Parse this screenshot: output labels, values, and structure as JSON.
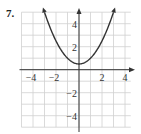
{
  "problem_number": "7.",
  "chart_data": {
    "type": "line",
    "title": "",
    "xlabel": "",
    "ylabel": "",
    "function": "y = 0.5x^2 + 0.5",
    "xlim": [
      -5,
      4.5
    ],
    "ylim": [
      -5,
      5
    ],
    "grid": true,
    "x_tick_labels": [
      "-4",
      "-2",
      "2",
      "4"
    ],
    "y_tick_labels": [
      "4",
      "2",
      "-2",
      "-4"
    ],
    "series": [
      {
        "name": "parabola",
        "x": [
          -3.1,
          -3,
          -2.5,
          -2,
          -1.5,
          -1,
          -0.5,
          0,
          0.5,
          1,
          1.5,
          2,
          2.5,
          3,
          3.1
        ],
        "y": [
          5.3,
          5,
          3.625,
          2.5,
          1.625,
          1,
          0.625,
          0.5,
          0.625,
          1,
          1.625,
          2.5,
          3.625,
          5,
          5.3
        ],
        "arrows_at_ends": true
      }
    ],
    "vertex": [
      0,
      0.5
    ],
    "legend": null
  },
  "colors": {
    "grid": "#d0d0d0",
    "axes": "#333333",
    "curve": "#333333"
  }
}
